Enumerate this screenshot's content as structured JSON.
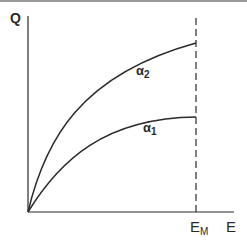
{
  "axes": {
    "y_label": "Q",
    "x_label": "E",
    "x_marker_label": "E",
    "x_marker_subscript": "M"
  },
  "curves": [
    {
      "name": "α",
      "subscript": "2",
      "description": "upper concave curve from origin to E_M"
    },
    {
      "name": "α",
      "subscript": "1",
      "description": "lower concave curve from origin to E_M"
    }
  ],
  "colors": {
    "line": "#2a2a2a",
    "background": "#ffffff"
  }
}
